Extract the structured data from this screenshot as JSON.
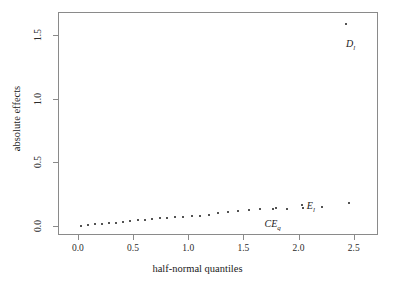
{
  "chart_data": {
    "type": "scatter",
    "title": "",
    "xlabel": "half-normal quantiles",
    "ylabel": "absolute effects",
    "xlim": [
      -0.18,
      2.72
    ],
    "ylim": [
      -0.07,
      1.68
    ],
    "xticks": [
      "0.0",
      "0.5",
      "1.0",
      "1.5",
      "2.0",
      "2.5"
    ],
    "xtickvalues": [
      0.0,
      0.5,
      1.0,
      1.5,
      2.0,
      2.5
    ],
    "yticks": [
      "0.0",
      "0.5",
      "1.0",
      "1.5"
    ],
    "ytickvalues": [
      0.0,
      0.5,
      1.0,
      1.5
    ],
    "grid": false,
    "legend": null,
    "x": [
      0.031,
      0.094,
      0.157,
      0.22,
      0.283,
      0.347,
      0.411,
      0.476,
      0.541,
      0.607,
      0.675,
      0.743,
      0.812,
      0.883,
      0.956,
      1.031,
      1.108,
      1.188,
      1.271,
      1.358,
      1.45,
      1.547,
      1.652,
      1.766,
      1.893,
      2.039,
      2.216,
      2.457
    ],
    "y": [
      0.004,
      0.009,
      0.014,
      0.018,
      0.022,
      0.027,
      0.031,
      0.037,
      0.043,
      0.05,
      0.057,
      0.061,
      0.065,
      0.069,
      0.073,
      0.078,
      0.083,
      0.089,
      0.098,
      0.11,
      0.12,
      0.126,
      0.131,
      0.134,
      0.136,
      0.143,
      0.151,
      0.176,
      1.586
    ],
    "points": [
      {
        "x": 0.031,
        "y": 0.004,
        "label": null
      },
      {
        "x": 0.094,
        "y": 0.009,
        "label": null
      },
      {
        "x": 0.157,
        "y": 0.014,
        "label": null
      },
      {
        "x": 0.22,
        "y": 0.018,
        "label": null
      },
      {
        "x": 0.283,
        "y": 0.022,
        "label": null
      },
      {
        "x": 0.347,
        "y": 0.026,
        "label": null
      },
      {
        "x": 0.411,
        "y": 0.031,
        "label": null
      },
      {
        "x": 0.476,
        "y": 0.037,
        "label": null
      },
      {
        "x": 0.541,
        "y": 0.044,
        "label": null
      },
      {
        "x": 0.607,
        "y": 0.051,
        "label": null
      },
      {
        "x": 0.675,
        "y": 0.057,
        "label": null
      },
      {
        "x": 0.743,
        "y": 0.061,
        "label": null
      },
      {
        "x": 0.812,
        "y": 0.065,
        "label": null
      },
      {
        "x": 0.883,
        "y": 0.069,
        "label": null
      },
      {
        "x": 0.956,
        "y": 0.073,
        "label": null
      },
      {
        "x": 1.031,
        "y": 0.078,
        "label": null
      },
      {
        "x": 1.108,
        "y": 0.083,
        "label": null
      },
      {
        "x": 1.188,
        "y": 0.09,
        "label": null
      },
      {
        "x": 1.271,
        "y": 0.1,
        "label": null
      },
      {
        "x": 1.358,
        "y": 0.112,
        "label": null
      },
      {
        "x": 1.45,
        "y": 0.121,
        "label": null
      },
      {
        "x": 1.547,
        "y": 0.127,
        "label": null
      },
      {
        "x": 1.652,
        "y": 0.131,
        "label": null
      },
      {
        "x": 1.766,
        "y": 0.134,
        "label": null
      },
      {
        "x": 1.893,
        "y": 0.137,
        "label": null
      },
      {
        "x": 2.039,
        "y": 0.144,
        "label": null
      },
      {
        "x": 2.216,
        "y": 0.152,
        "label": null
      },
      {
        "x": 2.457,
        "y": 0.178,
        "label": null
      },
      {
        "x": 1.8,
        "y": 0.145,
        "label": "CE",
        "label_sub": "q",
        "label_dx": -12,
        "label_dy": 10
      },
      {
        "x": 2.03,
        "y": 0.163,
        "label": "E",
        "label_sub": "l",
        "label_dx": 5,
        "label_dy": -5
      },
      {
        "x": 2.43,
        "y": 1.586,
        "label": "D",
        "label_sub": "l",
        "label_dx": 0,
        "label_dy": 14
      }
    ],
    "annotations": [
      {
        "text": "D",
        "sub": "l",
        "x": 2.43,
        "y": 1.586
      },
      {
        "text": "CE",
        "sub": "q",
        "x": 1.8,
        "y": 0.145
      },
      {
        "text": "E",
        "sub": "l",
        "x": 2.03,
        "y": 0.163
      }
    ],
    "colors": {
      "point": "#1a1a1a",
      "axis": "#8a8a8a",
      "text": "#1a1a1a",
      "background": "#ffffff"
    }
  }
}
